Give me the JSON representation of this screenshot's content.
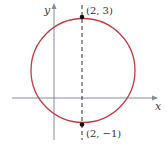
{
  "diagram": {
    "type": "circle-graph",
    "axes": {
      "x_label": "x",
      "y_label": "y"
    },
    "circle": {
      "center": [
        2,
        1
      ],
      "radius": 2,
      "color": "#c8373f"
    },
    "dashed_line": {
      "x": 2
    },
    "points": [
      {
        "label": "(2, 3)",
        "coords": [
          2,
          3
        ]
      },
      {
        "label": "(2, −1)",
        "coords": [
          2,
          -1
        ]
      }
    ]
  }
}
